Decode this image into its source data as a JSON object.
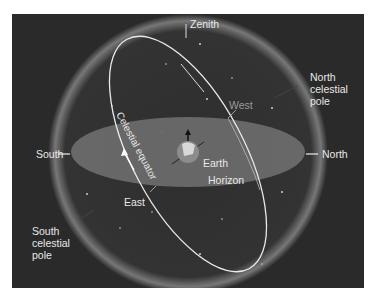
{
  "diagram": {
    "labels": {
      "zenith": "Zenith",
      "north_celestial_pole": [
        "North",
        "celestial",
        "pole"
      ],
      "south_celestial_pole": [
        "South",
        "celestial",
        "pole"
      ],
      "south": "South",
      "north": "North",
      "west": "West",
      "east": "East",
      "earth": "Earth",
      "horizon": "Horizon",
      "celestial_equator": "Celestial equator"
    },
    "colors": {
      "background": "#2a2a2a",
      "horizon_plane": "#6e6e6e",
      "sphere_glow": "#8a8a8a",
      "text": "#e8e8e8",
      "west_text": "#9a9a9a"
    }
  }
}
